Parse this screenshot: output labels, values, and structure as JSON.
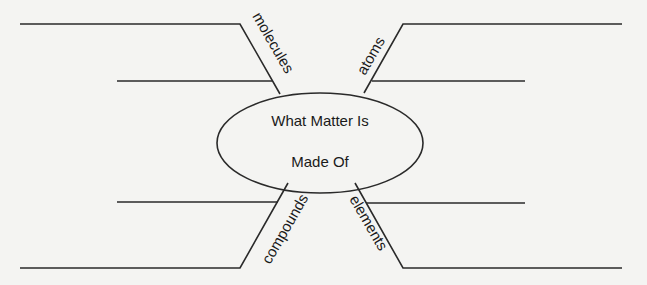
{
  "center": {
    "line1": "What Matter Is",
    "line2": "Made Of"
  },
  "branches": [
    {
      "position": "top-left",
      "label": "molecules"
    },
    {
      "position": "top-right",
      "label": "atoms"
    },
    {
      "position": "bottom-left",
      "label": "compounds"
    },
    {
      "position": "bottom-right",
      "label": "elements"
    }
  ],
  "colors": {
    "background": "#f4f4f2",
    "lines": "#2a2a2a",
    "text": "#1a1a1a"
  }
}
